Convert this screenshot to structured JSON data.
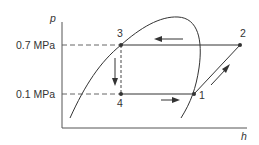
{
  "diagram": {
    "type": "p-h diagram (vapor-compression refrigeration cycle)",
    "axes": {
      "y_label": "p",
      "x_label": "h"
    },
    "pressure_levels": [
      {
        "label": "0.7 MPa",
        "y": 45
      },
      {
        "label": "0.1 MPa",
        "y": 94
      }
    ],
    "points": [
      {
        "id": "1",
        "label": "1",
        "x": 194,
        "y": 94
      },
      {
        "id": "2",
        "label": "2",
        "x": 240,
        "y": 45
      },
      {
        "id": "3",
        "label": "3",
        "x": 121,
        "y": 45
      },
      {
        "id": "4",
        "label": "4",
        "x": 121,
        "y": 94
      }
    ],
    "processes": [
      {
        "from": "1",
        "to": "2",
        "style": "solid"
      },
      {
        "from": "2",
        "to": "3",
        "style": "solid"
      },
      {
        "from": "3",
        "to": "4",
        "style": "dashed"
      },
      {
        "from": "4",
        "to": "1",
        "style": "solid"
      }
    ],
    "colors": {
      "line": "#333333",
      "background": "#ffffff"
    }
  }
}
